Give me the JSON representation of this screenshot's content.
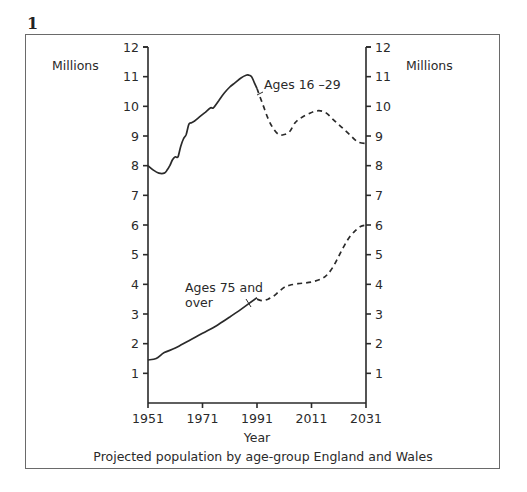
{
  "figure": {
    "number": "1",
    "caption": "Projected population by age-group England and Wales"
  },
  "chart_data": {
    "type": "line",
    "title": "Projected population by age-group England and Wales",
    "xlabel": "Year",
    "ylabel_left": "Millions",
    "ylabel_right": "Millions",
    "xlim": [
      1951,
      2031
    ],
    "ylim": [
      0,
      12
    ],
    "x_ticks": [
      1951,
      1971,
      1991,
      2011,
      2031
    ],
    "y_ticks": [
      1,
      2,
      3,
      4,
      5,
      6,
      7,
      8,
      9,
      10,
      11,
      12
    ],
    "grid": false,
    "legend": "inline annotations",
    "series": [
      {
        "name": "Ages 16 –29",
        "label_lines": [
          "Ages 16 –29"
        ],
        "actual": {
          "x": [
            1951,
            1953,
            1955,
            1957,
            1958,
            1959,
            1960,
            1961,
            1962,
            1963,
            1964,
            1965,
            1966,
            1967,
            1968,
            1970,
            1972,
            1974,
            1975,
            1977,
            1979,
            1981,
            1983,
            1985,
            1987,
            1988,
            1989,
            1990,
            1991
          ],
          "y": [
            8.0,
            7.85,
            7.75,
            7.75,
            7.85,
            8.0,
            8.2,
            8.3,
            8.3,
            8.65,
            8.9,
            9.05,
            9.4,
            9.45,
            9.5,
            9.65,
            9.8,
            9.95,
            9.95,
            10.2,
            10.45,
            10.65,
            10.8,
            10.95,
            11.05,
            11.05,
            11.0,
            10.8,
            10.6
          ]
        },
        "projected": {
          "x": [
            1991,
            1993,
            1995,
            1997,
            1999,
            2001,
            2003,
            2005,
            2007,
            2010,
            2013,
            2016,
            2019,
            2022,
            2025,
            2028,
            2031
          ],
          "y": [
            10.6,
            10.1,
            9.6,
            9.25,
            9.05,
            9.05,
            9.15,
            9.45,
            9.6,
            9.75,
            9.85,
            9.8,
            9.55,
            9.3,
            9.05,
            8.8,
            8.75
          ]
        }
      },
      {
        "name": "Ages 75 and over",
        "label_lines": [
          "Ages 75 and",
          "over"
        ],
        "actual": {
          "x": [
            1951,
            1954,
            1957,
            1961,
            1966,
            1971,
            1976,
            1981,
            1985,
            1988,
            1991
          ],
          "y": [
            1.45,
            1.5,
            1.7,
            1.85,
            2.1,
            2.35,
            2.6,
            2.9,
            3.15,
            3.35,
            3.55
          ]
        },
        "projected": {
          "x": [
            1991,
            1993,
            1995,
            1997,
            1999,
            2001,
            2003,
            2006,
            2009,
            2012,
            2015,
            2017,
            2019,
            2021,
            2023,
            2025,
            2027,
            2029,
            2031
          ],
          "y": [
            3.5,
            3.45,
            3.5,
            3.6,
            3.75,
            3.9,
            3.97,
            4.02,
            4.05,
            4.1,
            4.2,
            4.35,
            4.6,
            4.95,
            5.3,
            5.6,
            5.8,
            5.95,
            6.0
          ]
        }
      }
    ]
  },
  "axes": {
    "left_unit": "Millions",
    "right_unit": "Millions",
    "x_title": "Year"
  }
}
